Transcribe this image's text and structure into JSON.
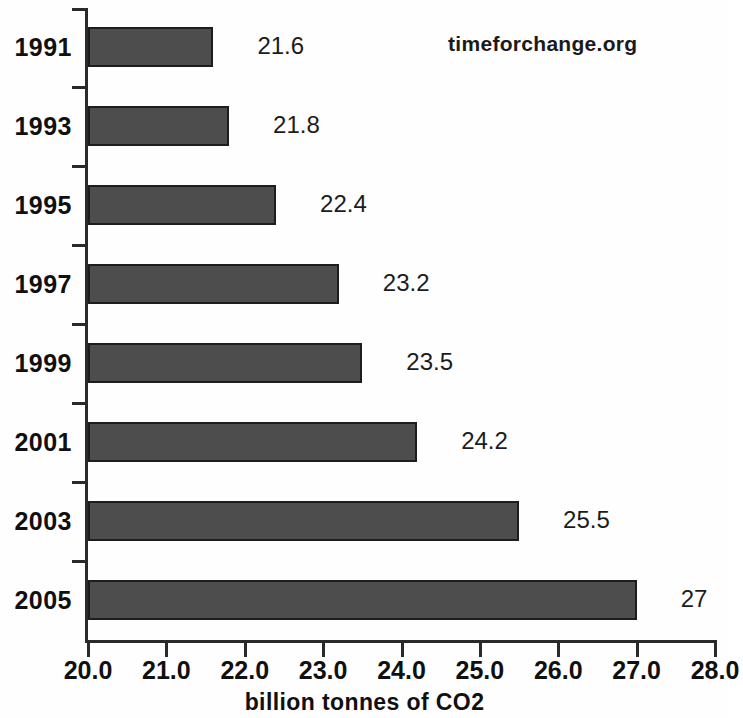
{
  "watermark": {
    "text": "timeforchange.org"
  },
  "chart_data": {
    "type": "bar",
    "orientation": "horizontal",
    "title": "",
    "subtitle": "",
    "xlabel": "billion tonnes of CO2",
    "ylabel": "",
    "categories": [
      "1991",
      "1993",
      "1995",
      "1997",
      "1999",
      "2001",
      "2003",
      "2005"
    ],
    "values": [
      21.6,
      21.8,
      22.4,
      23.2,
      23.5,
      24.2,
      25.5,
      27
    ],
    "value_labels": [
      "21.6",
      "21.8",
      "22.4",
      "23.2",
      "23.5",
      "24.2",
      "25.5",
      "27"
    ],
    "series": [
      {
        "name": "billion tonnes of CO2",
        "values": [
          21.6,
          21.8,
          22.4,
          23.2,
          23.5,
          24.2,
          25.5,
          27
        ]
      }
    ],
    "xlim": [
      20.0,
      28.0
    ],
    "xticks": [
      20.0,
      21.0,
      22.0,
      23.0,
      24.0,
      25.0,
      26.0,
      27.0,
      28.0
    ],
    "xtick_labels": [
      "20.0",
      "21.0",
      "22.0",
      "23.0",
      "24.0",
      "25.0",
      "26.0",
      "27.0",
      "28.0"
    ],
    "xtick_last_clipped": true,
    "grid": false,
    "legend": false,
    "legend_position": "none",
    "bar_color": "#4d4d4d",
    "bar_edge_color": "#1d1d1d",
    "background_color": "#fefefe",
    "axis_color": "#2a2a2a",
    "text_color": "#101010"
  }
}
